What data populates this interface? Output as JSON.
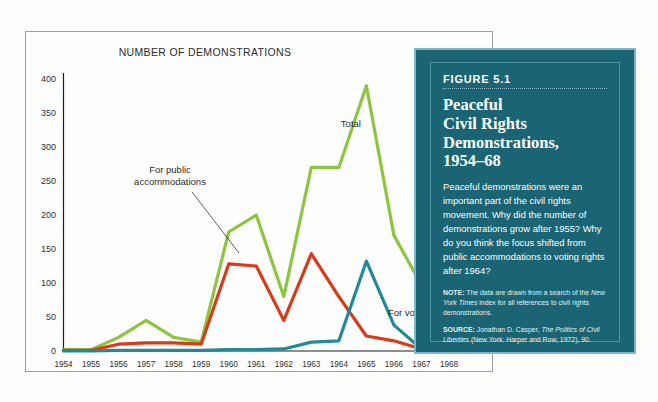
{
  "chart_data": {
    "type": "line",
    "title": "NUMBER OF DEMONSTRATIONS",
    "xlabel": "",
    "ylabel": "",
    "ylim": [
      0,
      400
    ],
    "yticks": [
      0,
      50,
      100,
      150,
      200,
      250,
      300,
      350,
      400
    ],
    "grid": false,
    "legend_position": "inline-annotations",
    "categories": [
      "1954",
      "1955",
      "1956",
      "1957",
      "1958",
      "1959",
      "1960",
      "1961",
      "1962",
      "1963",
      "1964",
      "1965",
      "1966",
      "1967",
      "1968"
    ],
    "series": [
      {
        "name": "Total",
        "color": "#8cc63e",
        "values": [
          2,
          2,
          20,
          45,
          20,
          13,
          175,
          200,
          80,
          270,
          270,
          390,
          170,
          97,
          102
        ]
      },
      {
        "name": "For public accommodations",
        "color": "#d93a17",
        "values": [
          1,
          1,
          10,
          12,
          12,
          10,
          128,
          125,
          45,
          143,
          80,
          22,
          15,
          3,
          5
        ]
      },
      {
        "name": "For voting",
        "color": "#1f8a99",
        "values": [
          0,
          0,
          1,
          1,
          1,
          1,
          2,
          2,
          3,
          13,
          15,
          132,
          38,
          3,
          3
        ]
      }
    ],
    "annotations": [
      {
        "text": "Total",
        "series": "Total"
      },
      {
        "text_line1": "For public",
        "text_line2": "accommodations",
        "series": "For public accommodations"
      },
      {
        "text": "For voting",
        "series": "For voting"
      }
    ]
  },
  "figure": {
    "number": "FIGURE 5.1",
    "title_line1": "Peaceful",
    "title_line2": "Civil Rights",
    "title_line3": "Demonstrations,",
    "title_line4": "1954–68",
    "body": "Peaceful demonstrations were an important part of the civil rights movement. Why did the number of demonstrations grow after 1955? Why do you think the focus shifted from public accommodations to voting rights after 1964?",
    "note_label": "NOTE:",
    "note_text_part1": " The data are drawn from a search of the ",
    "note_italic1": "New York Times",
    "note_text_part2": " index for all references to civil rights demonstrations.",
    "source_label": "SOURCE:",
    "source_text_part1": " Jonathan D. Casper, ",
    "source_italic1": "The Politics of Civil Liberties",
    "source_text_part2": " (New York: Harper and Row, 1972), 90."
  },
  "colors": {
    "total": "#8cc63e",
    "public_accommodations": "#d93a17",
    "voting": "#1f8a99",
    "box_background": "#1a6473",
    "box_border": "#7fb5c4"
  }
}
